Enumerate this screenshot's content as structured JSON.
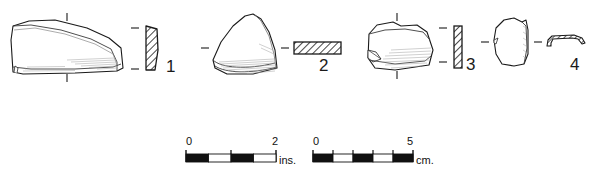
{
  "plate": {
    "background_color": "#ffffff",
    "ink_color": "#1a1a1a",
    "shading_color": "#9a9a9a",
    "type": "archaeological-artifact-plate",
    "caption": "",
    "figure_count": 4
  },
  "figures": [
    {
      "id": "figure-1",
      "number": "1",
      "plan_view_name": "sherd-outline-1",
      "profile_name": "sherd-profile-1",
      "profile_orientation": "vertical",
      "description": "large elongated sherd, plan view with interior shading, vertical hatched section profile",
      "tick_marks": [
        "top-center",
        "bottom-center",
        "profile-left-upper",
        "profile-left-lower"
      ]
    },
    {
      "id": "figure-2",
      "number": "2",
      "plan_view_name": "sherd-outline-2",
      "profile_name": "sherd-profile-2",
      "profile_orientation": "horizontal",
      "description": "rounded triangular sherd, plan view with basal shading, horizontal hatched bar section",
      "tick_marks": [
        "left-middle",
        "right-middle"
      ]
    },
    {
      "id": "figure-3",
      "number": "3",
      "plan_view_name": "sherd-outline-3",
      "profile_name": "sherd-profile-3",
      "profile_orientation": "vertical",
      "description": "trapezoidal sherd with chipped lower-left corner, vertical narrow hatched section",
      "tick_marks": [
        "top-center",
        "bottom-center",
        "profile-left-upper",
        "profile-left-lower"
      ]
    },
    {
      "id": "figure-4",
      "number": "4",
      "plan_view_name": "sherd-outline-4",
      "profile_name": "sherd-profile-4",
      "profile_orientation": "horizontal-curved",
      "description": "small irregular sherd with thickened right edge, thin curved hatched strip section",
      "tick_marks": [
        "left-middle",
        "right-middle"
      ]
    }
  ],
  "scales": [
    {
      "id": "scale-inches",
      "unit_label": "ins.",
      "start_label": "0",
      "end_label": "2",
      "min": 0,
      "max": 2,
      "segments": 4,
      "segment_value": 0.5,
      "segment_colors": [
        "#111111",
        "#ffffff",
        "#111111",
        "#ffffff"
      ],
      "tick_positions": [
        0,
        1,
        2
      ]
    },
    {
      "id": "scale-centimeters",
      "unit_label": "cm.",
      "start_label": "0",
      "end_label": "5",
      "min": 0,
      "max": 5,
      "segments": 5,
      "segment_value": 1,
      "segment_colors": [
        "#111111",
        "#ffffff",
        "#111111",
        "#ffffff",
        "#111111"
      ],
      "tick_positions": [
        0,
        1,
        2,
        3,
        4,
        5
      ]
    }
  ]
}
